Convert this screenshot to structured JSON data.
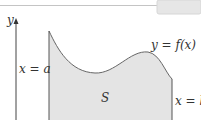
{
  "figure": {
    "axis_label_y": "y",
    "curve_label": "y = f(x)",
    "left_bound_label": "x = a",
    "right_bound_label": "x = b",
    "region_label": "S",
    "colors": {
      "region_fill": "#e4e4e4",
      "curve": "#555555",
      "axis": "#444444",
      "rule": "#bdbdbd",
      "badge": "#e6e6e6"
    }
  }
}
